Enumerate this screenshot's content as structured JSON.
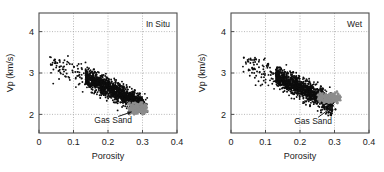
{
  "figure": {
    "panel_count": 2,
    "background_color": "#ffffff"
  },
  "chart_data": [
    {
      "type": "scatter",
      "title": "In Situ",
      "xlabel": "Porosity",
      "ylabel": "Vp (km/s)",
      "xlim": [
        0,
        0.4
      ],
      "ylim": [
        1.55,
        4.45
      ],
      "xticks": [
        0,
        0.1,
        0.2,
        0.3,
        0.4
      ],
      "xtick_labels": [
        "0",
        "0.1",
        "0.2",
        "0.3",
        "0.4"
      ],
      "yticks": [
        2,
        3,
        4
      ],
      "ytick_labels": [
        "2",
        "3",
        "4"
      ],
      "grid": true,
      "grid_style": "dotted",
      "grid_color": "#9a9a9a",
      "legend": "none",
      "annotations": [
        {
          "text": "Gas Sand",
          "x": 0.215,
          "y": 1.78,
          "points_to_x": 0.272,
          "points_to_y": 2.07,
          "arrow": true
        }
      ],
      "series": [
        {
          "name": "Background trend",
          "color": "#0d0d0d",
          "marker": "dot",
          "n_points": 1450,
          "description": "Dense elongated cloud trending from high Vp at low porosity to low Vp at high porosity",
          "trend_intercept_vp": 3.44,
          "trend_slope_vp_per_porosity": -4.0,
          "x_range": [
            0.03,
            0.315
          ],
          "y_range": [
            2.05,
            3.35
          ],
          "core_x_range": [
            0.135,
            0.305
          ],
          "core_y_range": [
            2.2,
            3.1
          ],
          "scatter_sigma": 0.12
        },
        {
          "name": "Gas Sand",
          "color": "#8c8c8c",
          "marker": "dot",
          "n_points": 220,
          "description": "Compact gray cluster at high porosity and low Vp, sitting below the background trend",
          "center_x": 0.288,
          "center_y": 2.14,
          "x_range": [
            0.258,
            0.315
          ],
          "y_range": [
            2.0,
            2.3
          ],
          "spread_x": 0.016,
          "spread_y": 0.065
        }
      ]
    },
    {
      "type": "scatter",
      "title": "Wet",
      "xlabel": "Porosity",
      "ylabel": "Vp (km/s)",
      "xlim": [
        0,
        0.4
      ],
      "ylim": [
        1.55,
        4.45
      ],
      "xticks": [
        0,
        0.1,
        0.2,
        0.3,
        0.4
      ],
      "xtick_labels": [
        "0",
        "0.1",
        "0.2",
        "0.3",
        "0.4"
      ],
      "yticks": [
        2,
        3,
        4
      ],
      "ytick_labels": [
        "2",
        "3",
        "4"
      ],
      "grid": true,
      "grid_style": "dotted",
      "grid_color": "#9a9a9a",
      "legend": "none",
      "annotations": [
        {
          "text": "Gas Sand",
          "x": 0.238,
          "y": 1.76,
          "points_to_x": 0.3,
          "points_to_y": 2.22,
          "arrow": true
        }
      ],
      "series": [
        {
          "name": "Background trend",
          "color": "#0d0d0d",
          "marker": "dot",
          "n_points": 1450,
          "description": "Dense elongated cloud trending from high Vp at low porosity to low Vp at high porosity",
          "trend_intercept_vp": 3.46,
          "trend_slope_vp_per_porosity": -4.1,
          "x_range": [
            0.03,
            0.305
          ],
          "y_range": [
            2.02,
            3.35
          ],
          "core_x_range": [
            0.13,
            0.295
          ],
          "core_y_range": [
            2.2,
            3.12
          ],
          "scatter_sigma": 0.12
        },
        {
          "name": "Gas Sand",
          "color": "#8c8c8c",
          "marker": "dot",
          "n_points": 220,
          "description": "Gray cluster shifted to higher Vp than in situ case, overlapping the lower edge of the background trend",
          "center_x": 0.288,
          "center_y": 2.4,
          "x_range": [
            0.252,
            0.318
          ],
          "y_range": [
            2.26,
            2.56
          ],
          "spread_x": 0.018,
          "spread_y": 0.062
        }
      ]
    }
  ]
}
